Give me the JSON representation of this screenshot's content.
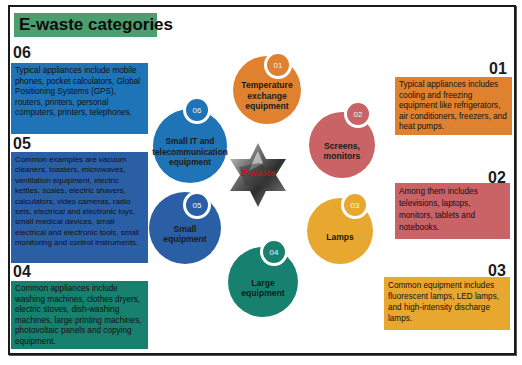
{
  "title": "E-waste categories",
  "center": {
    "label": "E-waste",
    "icon": "ewaste-star-photo"
  },
  "colors": {
    "title_bg": "#4c9e6e",
    "cat01": "#e0812f",
    "cat02": "#c96366",
    "cat03": "#e8a830",
    "cat04": "#17806e",
    "cat05": "#2a5fa6",
    "cat06": "#1f73b7"
  },
  "categories": [
    {
      "number": "01",
      "name": "Temperature exchange equipment",
      "description": "Typical appliances includes cooling and freezing equipment like refrigerators, air conditioners, freezers, and heat pumps."
    },
    {
      "number": "02",
      "name": "Screens, monitors",
      "description": "Among them includes televisions, laptops, monitors, tablets and notebooks."
    },
    {
      "number": "03",
      "name": "Lamps",
      "description": "Common equipment includes fluorescent lamps, LED lamps, and high-intensity discharge lamps."
    },
    {
      "number": "04",
      "name": "Large equipment",
      "description": "Common appliances include washing machines, clothes dryers, electric stoves, dish-washing machines, large printing machines, photovoltaic panels and copying equipment."
    },
    {
      "number": "05",
      "name": "Small equipment",
      "description": "Common examples are vacuum cleaners, toasters, microwaves, ventilation equipment, electric kettles, scales, electric shavers, calculators, video cameras, radio sets, electrical and electronic toys, small medical devices, small electrical and electronic tools, small monitoring and control instruments."
    },
    {
      "number": "06",
      "name": "Small IT and telecommunication equipment",
      "description": "Typical appliances include mobile phones, pocket calculators, Global Positioning Systems (GPS), routers, printers, personal computers, printers, telephones."
    }
  ]
}
